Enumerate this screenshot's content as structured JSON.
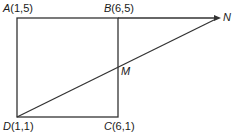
{
  "diagram": {
    "title": "",
    "points": {
      "A": {
        "name": "A",
        "coords": "(1,5)"
      },
      "B": {
        "name": "B",
        "coords": "(6,5)"
      },
      "C": {
        "name": "C",
        "coords": "(6,1)"
      },
      "D": {
        "name": "D",
        "coords": "(1,1)"
      },
      "M": {
        "name": "M",
        "coords": ""
      },
      "N": {
        "name": "N",
        "coords": ""
      }
    },
    "segments": [
      "AB",
      "BC",
      "CD",
      "DA",
      "BN",
      "DN"
    ],
    "line_color": "#333333"
  }
}
